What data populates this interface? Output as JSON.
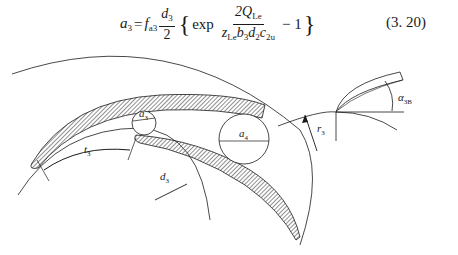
{
  "equation": {
    "lhs": "a",
    "lhs_sub": "3",
    "equals": "=",
    "coef": "f",
    "coef_sub": "a3",
    "frac1_num": "d",
    "frac1_num_sub": "3",
    "frac1_den": "2",
    "left_brace": "{",
    "exp_word": "exp",
    "frac2_num_prefix": "2Q",
    "frac2_num_sub": "Le",
    "frac2_den": [
      {
        "sym": "z",
        "sub": "Le"
      },
      {
        "sym": "b",
        "sub": "3"
      },
      {
        "sym": "d",
        "sub": "2"
      },
      {
        "sym": "c",
        "sub": "2u"
      }
    ],
    "minus_one": "− 1",
    "right_brace": "}",
    "number": "(3. 20)"
  },
  "figure": {
    "labels": {
      "a3": {
        "sym": "a",
        "sub": "3"
      },
      "a4": {
        "sym": "a",
        "sub": "4"
      },
      "t3": {
        "sym": "t",
        "sub": "3"
      },
      "d3": {
        "sym": "d",
        "sub": "3"
      },
      "r3": {
        "sym": "r",
        "sub": "3"
      },
      "alpha3B": {
        "sym": "α",
        "sub": "3B"
      }
    },
    "colors": {
      "line": "#1a1a1a",
      "hatch": "#444444"
    }
  }
}
